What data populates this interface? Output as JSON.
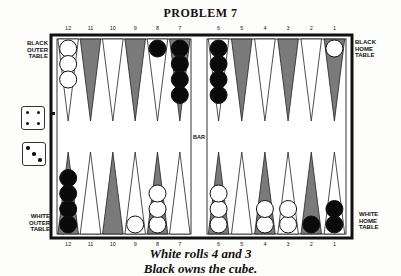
{
  "title": "PROBLEM 7",
  "labels": {
    "black_outer": [
      "BLACK",
      "OUTER",
      "TABLE"
    ],
    "black_home": [
      "BLACK",
      "HOME",
      "TABLE"
    ],
    "white_outer": [
      "WHITE",
      "OUTER",
      "TABLE"
    ],
    "white_home": [
      "WHITE",
      "HOME",
      "TABLE"
    ],
    "bar": "BAR"
  },
  "point_numbers": {
    "left": [
      "12",
      "11",
      "10",
      "9",
      "8",
      "7"
    ],
    "right": [
      "6",
      "5",
      "4",
      "3",
      "2",
      "1"
    ]
  },
  "position": {
    "top": [
      {
        "label": "12",
        "shade": "light",
        "color": "white",
        "count": 3
      },
      {
        "label": "11",
        "shade": "dark",
        "color": null,
        "count": 0
      },
      {
        "label": "10",
        "shade": "light",
        "color": null,
        "count": 0
      },
      {
        "label": "9",
        "shade": "dark",
        "color": null,
        "count": 0
      },
      {
        "label": "8",
        "shade": "light",
        "color": "black",
        "count": 1
      },
      {
        "label": "7",
        "shade": "dark",
        "color": "black",
        "count": 4
      },
      {
        "label": "6",
        "shade": "light",
        "color": "black",
        "count": 4
      },
      {
        "label": "5",
        "shade": "dark",
        "color": null,
        "count": 0
      },
      {
        "label": "4",
        "shade": "light",
        "color": null,
        "count": 0
      },
      {
        "label": "3",
        "shade": "dark",
        "color": null,
        "count": 0
      },
      {
        "label": "2",
        "shade": "light",
        "color": null,
        "count": 0
      },
      {
        "label": "1",
        "shade": "dark",
        "color": "white",
        "count": 1
      }
    ],
    "bottom": [
      {
        "label": "12",
        "shade": "dark",
        "color": "black",
        "count": 4
      },
      {
        "label": "11",
        "shade": "light",
        "color": null,
        "count": 0
      },
      {
        "label": "10",
        "shade": "dark",
        "color": null,
        "count": 0
      },
      {
        "label": "9",
        "shade": "light",
        "color": "white",
        "count": 1
      },
      {
        "label": "8",
        "shade": "dark",
        "color": "white",
        "count": 3
      },
      {
        "label": "7",
        "shade": "light",
        "color": null,
        "count": 0
      },
      {
        "label": "6",
        "shade": "dark",
        "color": "white",
        "count": 3
      },
      {
        "label": "5",
        "shade": "light",
        "color": null,
        "count": 0
      },
      {
        "label": "4",
        "shade": "dark",
        "color": "white",
        "count": 2
      },
      {
        "label": "3",
        "shade": "light",
        "color": "white",
        "count": 2
      },
      {
        "label": "2",
        "shade": "dark",
        "color": "black",
        "count": 1
      },
      {
        "label": "1",
        "shade": "light",
        "color": "black",
        "count": 2
      }
    ]
  },
  "dice": [
    4,
    3
  ],
  "caption": {
    "line1": "White rolls 4 and 3",
    "line2": "Black owns the cube."
  },
  "colors": {
    "dark_point": "#7a7a7a",
    "light_point": "#ffffff",
    "black_checker": "#0a0a0a",
    "white_checker": "#ffffff",
    "frame": "#111111"
  }
}
